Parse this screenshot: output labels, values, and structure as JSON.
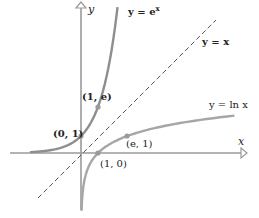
{
  "diagram": {
    "axes": {
      "x_label": "x",
      "y_label": "y"
    },
    "curves": [
      {
        "name": "exp",
        "label": "y = e^x",
        "label_main": "y = e",
        "label_sup": "x",
        "color": "#8a8a8a"
      },
      {
        "name": "identity",
        "label": "y = x",
        "style": "dashed",
        "color": "#444444"
      },
      {
        "name": "ln",
        "label": "y = ln x",
        "color": "#a0a0a0"
      }
    ],
    "points": [
      {
        "label": "(1, e)",
        "x": 1,
        "y": 2.718
      },
      {
        "label": "(0, 1)",
        "x": 0,
        "y": 1
      },
      {
        "label": "(e, 1)",
        "x": 2.718,
        "y": 1
      },
      {
        "label": "(1, 0)",
        "x": 1,
        "y": 0
      }
    ],
    "colors": {
      "axis": "#9a9a9a",
      "curve": "#9a9a9a",
      "dashed": "#555555",
      "dot": "#9a9a9a"
    }
  }
}
